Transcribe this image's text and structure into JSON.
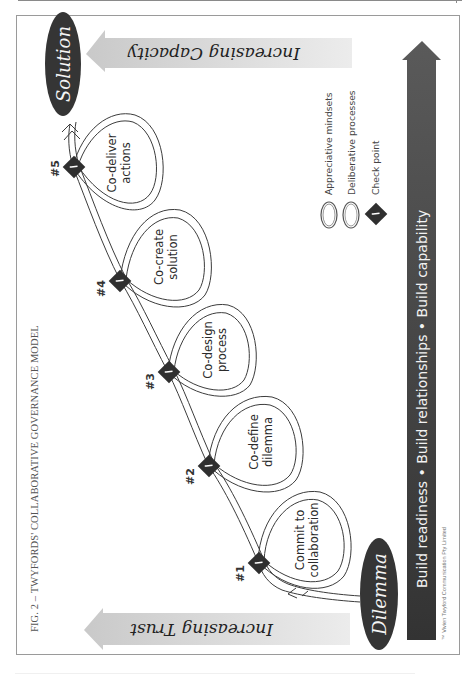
{
  "figure": {
    "caption": "FIG. 2 – TWYFORDS' COLLABORATIVE GOVERNANCE MODEL",
    "copyright": "™ Vivien Twyford Communication Pty Limited"
  },
  "endpoints": {
    "start": "Dilemma",
    "end": "Solution"
  },
  "bands": {
    "top": "Increasing Capacity",
    "bottom": "Increasing Trust"
  },
  "stages": [
    {
      "number": "#1",
      "line1": "Commit to",
      "line2": "collaboration"
    },
    {
      "number": "#2",
      "line1": "Co-define",
      "line2": "dilemma"
    },
    {
      "number": "#3",
      "line1": "Co-design",
      "line2": "process"
    },
    {
      "number": "#4",
      "line1": "Co-create",
      "line2": "solution"
    },
    {
      "number": "#5",
      "line1": "Co-deliver",
      "line2": "actions"
    }
  ],
  "legend": [
    {
      "icon": "appreciative-loop-icon",
      "label": "Appreciative mindsets"
    },
    {
      "icon": "deliberative-loop-icon",
      "label": "Deliberative processes"
    },
    {
      "icon": "checkpoint-icon",
      "label": "Check point"
    }
  ],
  "progress_bar": {
    "label": "Build readiness • Build relationships • Build capability"
  },
  "colors": {
    "dark": "#3a3a3a",
    "band": "#d6d6d6",
    "line": "#3c3c3c"
  }
}
